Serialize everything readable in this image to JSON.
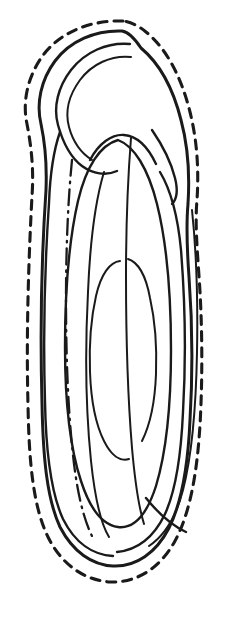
{
  "figure": {
    "title": "Longitudinal section line drawing of an elongate seed-like body with apical hooked beak",
    "domain": "technical line illustration",
    "canvas": {
      "width": 228,
      "height": 628,
      "background": "#ffffff"
    },
    "ink_color": "#1a1a1a",
    "subject_bounds": {
      "x_min": 16,
      "y_min": 20,
      "x_max": 206,
      "y_max": 584
    },
    "stroke_styles": {
      "outer_dashed": {
        "name": "outer-dashed-contour",
        "width": 3.1,
        "dasharray": "9 7",
        "description": "dashed outermost envelope outline"
      },
      "outline_solid": {
        "name": "solid-outline",
        "width": 3.0,
        "dasharray": "none",
        "description": "heavy solid primary outline"
      },
      "inner_solid": {
        "name": "inner-solid-contour",
        "width": 2.4,
        "dasharray": "none",
        "description": "medium solid interior contour"
      },
      "fine_solid": {
        "name": "fine-solid-contour",
        "width": 2.0,
        "dasharray": "none",
        "description": "fine solid interior contour"
      },
      "center_dashdot": {
        "name": "center-dash-dot-axis",
        "width": 2.3,
        "dasharray": "16 6 1.6 6",
        "description": "dash-dot longitudinal axis line"
      }
    },
    "elements": [
      {
        "name": "outer-dashed-contour",
        "style": "outer_dashed",
        "label": "Dashed outer envelope",
        "path": "M 123 21 C 92 20 62 31 44 54 C 28 75 22 101 27 124 C 31 145 34 168 32 196 C 29 252 26 330 28 405 C 29 462 33 506 48 537 C 62 565 84 580 110 582 C 137 583 160 568 175 541 C 190 513 197 474 200 425 C 203 372 202 318 199 276 C 197 247 195 222 197 200 C 199 169 197 140 190 112 C 181 76 166 48 146 32 C 139 26 131 22 123 21 Z"
      },
      {
        "name": "solid-outline",
        "style": "outline_solid",
        "label": "Primary solid outline of body and beak",
        "path": "M 122 31 C 95 30 70 41 55 61 C 41 80 36 103 41 124 C 45 143 47 165 46 190 C 42 250 40 330 42 403 C 43 458 47 499 60 527 C 73 552 92 565 113 566 C 136 567 156 553 169 528 C 182 502 188 466 190 420 C 193 369 192 317 189 277 C 187 249 186 226 188 204 C 190 173 188 146 181 120 C 173 88 159 63 141 48 C 135 39 129 32 122 31 Z"
      },
      {
        "name": "beak-loop-inner-arc",
        "style": "inner_solid",
        "label": "Inner arc of apical hooked beak",
        "path": "M 130 44 C 107 42 85 52 71 70 C 58 87 53 107 58 125 C 63 143 70 157 82 166 C 93 174 106 176 117 171"
      },
      {
        "name": "beak-loop-innermost-arc",
        "style": "fine_solid",
        "label": "Innermost arc of apical beak loop",
        "path": "M 131 57 C 111 55 92 64 80 80 C 69 95 65 112 69 127 C 73 142 81 153 92 160"
      },
      {
        "name": "beak-throat-curve",
        "style": "inner_solid",
        "label": "Throat curve joining beak to body",
        "path": "M 90 160 C 99 143 112 134 124 135 C 137 136 148 147 156 164"
      },
      {
        "name": "body-inner-left-contour",
        "style": "inner_solid",
        "label": "Inner left contour of body wall",
        "path": "M 60 132 C 53 152 50 176 49 203 C 45 262 43 334 45 402 C 46 454 51 493 63 519 C 75 543 93 555 113 556"
      },
      {
        "name": "body-inner-right-contour",
        "style": "inner_solid",
        "label": "Inner right contour of body wall",
        "path": "M 160 172 C 172 192 178 218 181 250 C 185 300 186 360 183 412 C 181 457 176 490 165 514 C 154 537 137 550 117 552"
      },
      {
        "name": "kernel-outline",
        "style": "inner_solid",
        "label": "Large inner kernel outline",
        "path": "M 118 140 C 100 145 86 167 78 201 C 69 240 65 293 65 347 C 65 400 70 448 81 481 C 90 509 103 525 118 527 C 134 529 147 514 156 486 C 166 453 171 405 171 350 C 171 295 167 244 157 204 C 148 168 134 146 118 140 Z"
      },
      {
        "name": "kernel-inner-oval",
        "style": "fine_solid",
        "label": "Inner oval embryo outline",
        "path": "M 120 261 C 110 262 101 274 96 296 C 91 318 89 345 90 372 C 91 400 96 425 104 441 C 111 455 120 462 129 459"
      },
      {
        "name": "kernel-inner-oval-right",
        "style": "fine_solid",
        "label": "Right side of inner oval embryo outline",
        "path": "M 128 259 C 138 262 146 276 150 298 C 155 320 157 347 156 374 C 155 401 150 425 142 441"
      },
      {
        "name": "hilum-fine-line",
        "style": "fine_solid",
        "label": "Fine internal raphe line",
        "path": "M 131 138 C 128 176 126 222 126 276 C 126 338 128 400 132 448 C 135 482 139 508 144 524"
      },
      {
        "name": "inner-partition-line",
        "style": "fine_solid",
        "label": "Interior partition line from beak to base",
        "path": "M 104 172 C 95 202 90 243 88 292 C 85 350 86 412 91 461 C 95 499 101 524 109 537"
      },
      {
        "name": "center-dash-dot-axis",
        "style": "center_dashdot",
        "label": "Dash-dot longitudinal centerline",
        "path": "M 72 160 C 68 200 66 248 66 300 C 66 356 68 410 73 455 C 77 493 84 521 93 538"
      },
      {
        "name": "right-shoulder-notch-line",
        "style": "inner_solid",
        "label": "Notch line at right shoulder where beak meets body",
        "path": "M 152 130 C 163 146 171 162 175 178 C 178 190 177 199 172 204"
      },
      {
        "name": "right-margin-fine-line",
        "style": "fine_solid",
        "label": "Fine line along right margin",
        "path": "M 192 210 C 196 248 198 300 197 352 C 196 408 192 455 183 490 C 176 517 164 536 149 546"
      },
      {
        "name": "base-fold-line",
        "style": "inner_solid",
        "label": "Fold line at base of body",
        "path": "M 146 498 C 158 513 171 525 186 532"
      }
    ]
  }
}
